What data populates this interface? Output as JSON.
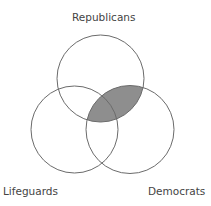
{
  "diagram": {
    "type": "venn",
    "sets": [
      {
        "name": "Republicans",
        "position": "top"
      },
      {
        "name": "Lifeguards",
        "position": "bottom-left"
      },
      {
        "name": "Democrats",
        "position": "bottom-right"
      }
    ],
    "shaded_region": "Republicans ∩ Democrats",
    "colors": {
      "stroke": "#6b6b6b",
      "shade": "#8e8e8e",
      "background": "#ffffff",
      "text": "#444444"
    }
  },
  "labels": {
    "top": "Republicans",
    "left": "Lifeguards",
    "right": "Democrats"
  }
}
